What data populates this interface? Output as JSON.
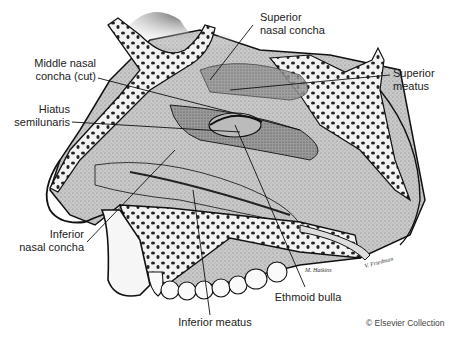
{
  "figure": {
    "labels": [
      {
        "id": "superior-nasal-concha",
        "line1": "Superior",
        "line2": "nasal concha"
      },
      {
        "id": "superior-meatus",
        "line1": "Superior",
        "line2": "meatus"
      },
      {
        "id": "middle-nasal-concha",
        "line1": "Middle nasal",
        "line2": "concha (cut)"
      },
      {
        "id": "hiatus-semilunaris",
        "line1": "Hiatus",
        "line2": "semilunaris"
      },
      {
        "id": "inferior-nasal-concha",
        "line1": "Inferior",
        "line2": "nasal concha"
      },
      {
        "id": "inferior-meatus",
        "line1": "Inferior meatus",
        "line2": ""
      },
      {
        "id": "ethmoid-bulla",
        "line1": "Ethmoid bulla",
        "line2": ""
      }
    ],
    "credit": "© Elsevier Collection",
    "colors": {
      "ink": "#1a1a1a",
      "mucosa_light": "#cfcfcf",
      "mucosa_mid": "#a8a8a8",
      "mucosa_dark": "#7a7a7a",
      "bone": "#f4f4f4",
      "background": "#ffffff"
    }
  }
}
